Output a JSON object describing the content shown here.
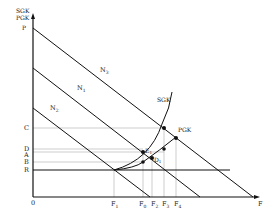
{
  "diagram": {
    "y_axis_labels": [
      "SGK",
      "PGK",
      "P"
    ],
    "x_axis_label": "F",
    "origin_label": "0",
    "y_ticks": [
      {
        "label": "C",
        "y": 128
      },
      {
        "label": "D",
        "y": 149
      },
      {
        "label": "A",
        "y": 153
      },
      {
        "label": "B",
        "y": 162
      },
      {
        "label": "R",
        "y": 170
      }
    ],
    "x_ticks": [
      {
        "label": "F",
        "sub": "1",
        "x": 114
      },
      {
        "label": "F",
        "sub": "0",
        "x": 143
      },
      {
        "label": "F",
        "sub": "2",
        "x": 152
      },
      {
        "label": "F",
        "sub": "3",
        "x": 164
      },
      {
        "label": "F",
        "sub": "4",
        "x": 176
      }
    ],
    "demand_curves": [
      {
        "label": "N",
        "sub": "3"
      },
      {
        "label": "N",
        "sub": "1"
      },
      {
        "label": "N",
        "sub": "2"
      }
    ],
    "curve_labels": {
      "sgk": "SGK",
      "pgk": "PGK"
    },
    "points": [
      {
        "label": "E",
        "sub": "1"
      },
      {
        "label": "D",
        "sub": "1"
      }
    ]
  }
}
